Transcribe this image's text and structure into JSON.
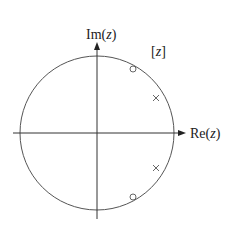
{
  "diagram": {
    "region_label": "[z]",
    "region_label_parts": {
      "open": "[",
      "var": "z",
      "close": "]"
    },
    "axes": {
      "x_label": "Re(z)",
      "x_label_parts": {
        "prefix": "Re(",
        "var": "z",
        "suffix": ")"
      },
      "y_label": "Im(z)",
      "y_label_parts": {
        "prefix": "Im(",
        "var": "z",
        "suffix": ")"
      }
    },
    "unit_circle": {
      "center": [
        97,
        133
      ],
      "radius": 77,
      "color": "#555555"
    },
    "zeros": [
      {
        "symbol": "o",
        "x": 133,
        "y": 69
      },
      {
        "symbol": "o",
        "x": 133,
        "y": 197
      }
    ],
    "poles": [
      {
        "symbol": "x",
        "x": 156,
        "y": 98
      },
      {
        "symbol": "x",
        "x": 156,
        "y": 168
      }
    ],
    "colors": {
      "stroke": "#333333",
      "circle": "#555555",
      "marker": "#666666"
    }
  }
}
